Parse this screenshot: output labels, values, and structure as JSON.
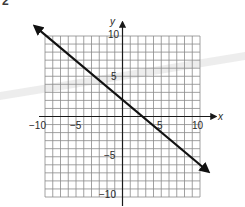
{
  "page": {
    "corner_glyph": "2"
  },
  "chart_data": {
    "type": "line",
    "title": "",
    "xlabel": "x",
    "ylabel": "y",
    "xlim": [
      -10,
      10
    ],
    "ylim": [
      -10,
      10
    ],
    "grid": true,
    "grid_step": 1,
    "x_tick_labels": [
      "-10",
      "-5",
      "5",
      "10"
    ],
    "y_tick_labels": [
      "10",
      "5",
      "-5",
      "-10"
    ],
    "series": [
      {
        "name": "line",
        "equation": "y = -0.8x + 2",
        "slope": -0.8,
        "intercept": 2,
        "x": [
          -11,
          -10,
          -5,
          0,
          2.5,
          5,
          10,
          11
        ],
        "y": [
          10.8,
          10,
          6,
          2,
          0,
          -2,
          -6,
          -6.8
        ],
        "arrows_both_ends": true
      }
    ],
    "legend": null
  },
  "labels": {
    "x_axis": "x",
    "y_axis": "y",
    "x_neg10": "−10",
    "x_neg5": "−5",
    "x_pos5": "5",
    "x_pos10": "10",
    "y_pos10": "10",
    "y_pos5": "5",
    "y_neg5": "−5",
    "y_neg10": "−10"
  },
  "colors": {
    "grid": "#8a8a8a",
    "axis": "#1a1a1a",
    "line": "#111111",
    "streak": "#d8d8d8"
  }
}
